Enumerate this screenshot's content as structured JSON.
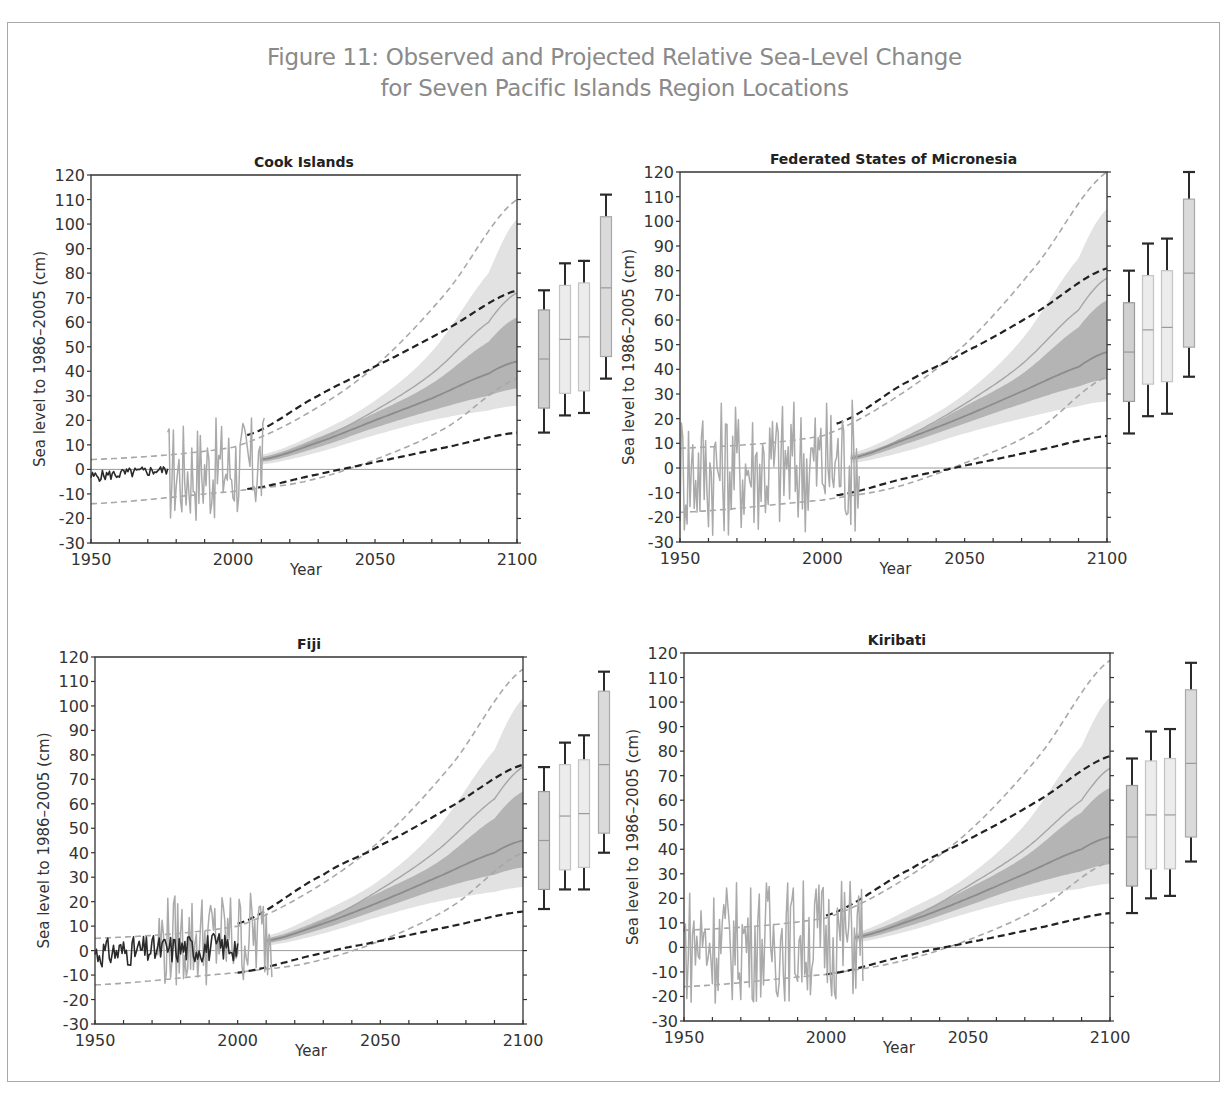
{
  "figure": {
    "title_line1": "Figure 11: Observed and Projected Relative Sea-Level Change",
    "title_line2": "for Seven Pacific Islands Region Locations"
  },
  "colors": {
    "title": "#8a8a8a",
    "axis": "#333333",
    "zero_line": "#9a9a9a",
    "obs_tide_gauge_dark": "#2a2a2a",
    "obs_altimetry_light": "#aaaaaa",
    "band_light": "#e2e2e2",
    "band_dark": "#b4b4b4",
    "median_line": "#8c8c8c",
    "high_line": "#a6a6a6",
    "dash_black": "#222222",
    "dash_gray": "#a8a8a8",
    "box_dark": "#d0d0d0",
    "box_light": "#ececec",
    "box_mid": "#dadada",
    "whisker": "#2a2a2a"
  },
  "chart_data": [
    {
      "type": "line",
      "title": "Cook Islands",
      "xlabel": "Year",
      "ylabel": "Sea level to 1986–2005 (cm)",
      "xlim": [
        1950,
        2100
      ],
      "ylim": [
        -30,
        120
      ],
      "xticks": [
        1950,
        2000,
        2050,
        2100
      ],
      "yticks": [
        -30,
        -20,
        -10,
        0,
        10,
        20,
        30,
        40,
        50,
        60,
        70,
        80,
        90,
        100,
        110,
        120
      ],
      "grid": false,
      "plot_px": {
        "left": 91,
        "top": 175,
        "right": 517,
        "bottom": 543
      },
      "box_x": [
        544,
        565,
        584,
        606
      ],
      "observed_dark": {
        "x_range": [
          1950,
          1977
        ],
        "values_range": [
          -7,
          1
        ]
      },
      "observed_light": {
        "x_range": [
          1977,
          2011
        ],
        "values_range": [
          -24,
          21
        ]
      },
      "projection_light_band": {
        "x": [
          2010,
          2030,
          2050,
          2070,
          2090,
          2100
        ],
        "low": [
          2,
          7,
          14,
          20,
          24,
          26
        ],
        "high": [
          6,
          15,
          28,
          48,
          80,
          102
        ]
      },
      "projection_dark_band": {
        "x": [
          2010,
          2030,
          2050,
          2070,
          2090,
          2100
        ],
        "low": [
          3,
          9,
          17,
          24,
          30,
          33
        ],
        "high": [
          5,
          13,
          23,
          35,
          52,
          62
        ]
      },
      "median_line": {
        "x": [
          2010,
          2030,
          2050,
          2070,
          2090,
          2100
        ],
        "y": [
          4,
          11,
          20,
          29,
          39,
          44
        ]
      },
      "high_scenario_line": {
        "x": [
          2010,
          2030,
          2050,
          2070,
          2090,
          2100
        ],
        "y": [
          4,
          12,
          24,
          39,
          60,
          72
        ]
      },
      "dashed_black_upper": {
        "x": [
          2005,
          2030,
          2050,
          2075,
          2100
        ],
        "y": [
          14,
          30,
          42,
          57,
          73
        ]
      },
      "dashed_black_lower": {
        "x": [
          2005,
          2030,
          2050,
          2075,
          2100
        ],
        "y": [
          -8,
          -2,
          3,
          9,
          15
        ]
      },
      "dashed_gray_upper": {
        "x": [
          1950,
          2000,
          2025,
          2050,
          2075,
          2100
        ],
        "y": [
          4,
          9,
          22,
          42,
          72,
          110
        ]
      },
      "dashed_gray_lower": {
        "x": [
          1950,
          2000,
          2025,
          2050,
          2075,
          2100
        ],
        "y": [
          -14,
          -9,
          -5,
          4,
          17,
          37
        ]
      },
      "boxes": [
        {
          "name": "RCP2.6",
          "fill": "dark",
          "whisker_low": 15,
          "q1": 25,
          "median": 45,
          "q3": 65,
          "whisker_high": 73
        },
        {
          "name": "RCP4.5",
          "fill": "light",
          "whisker_low": 22,
          "q1": 31,
          "median": 53,
          "q3": 75,
          "whisker_high": 84
        },
        {
          "name": "RCP6.0",
          "fill": "light",
          "whisker_low": 23,
          "q1": 32,
          "median": 54,
          "q3": 76,
          "whisker_high": 85
        },
        {
          "name": "RCP8.5",
          "fill": "mid",
          "whisker_low": 37,
          "q1": 46,
          "median": 74,
          "q3": 103,
          "whisker_high": 112
        }
      ]
    },
    {
      "type": "line",
      "title": "Federated States of Micronesia",
      "xlabel": "Year",
      "ylabel": "Sea level to 1986–2005 (cm)",
      "xlim": [
        1950,
        2100
      ],
      "ylim": [
        -30,
        120
      ],
      "xticks": [
        1950,
        2000,
        2050,
        2100
      ],
      "yticks": [
        -30,
        -20,
        -10,
        0,
        10,
        20,
        30,
        40,
        50,
        60,
        70,
        80,
        90,
        100,
        110,
        120
      ],
      "grid": false,
      "plot_px": {
        "left": 680,
        "top": 172,
        "right": 1107,
        "bottom": 542
      },
      "box_x": [
        1129,
        1148,
        1167,
        1189
      ],
      "observed_dark": null,
      "observed_light": {
        "x_range": [
          1950,
          2013
        ],
        "values_range": [
          -30,
          29
        ]
      },
      "projection_light_band": {
        "x": [
          2010,
          2030,
          2050,
          2070,
          2090,
          2100
        ],
        "low": [
          2,
          7,
          14,
          20,
          25,
          27
        ],
        "high": [
          6,
          16,
          30,
          52,
          85,
          105
        ]
      },
      "projection_dark_band": {
        "x": [
          2010,
          2030,
          2050,
          2070,
          2090,
          2100
        ],
        "low": [
          3,
          10,
          18,
          26,
          33,
          36
        ],
        "high": [
          5,
          13,
          25,
          38,
          57,
          68
        ]
      },
      "median_line": {
        "x": [
          2010,
          2030,
          2050,
          2070,
          2090,
          2100
        ],
        "y": [
          4,
          12,
          21,
          31,
          41,
          47
        ]
      },
      "high_scenario_line": {
        "x": [
          2010,
          2030,
          2050,
          2070,
          2090,
          2100
        ],
        "y": [
          4,
          13,
          26,
          42,
          64,
          77
        ]
      },
      "dashed_black_upper": {
        "x": [
          2005,
          2030,
          2050,
          2075,
          2100
        ],
        "y": [
          18,
          35,
          47,
          63,
          81
        ]
      },
      "dashed_black_lower": {
        "x": [
          2005,
          2030,
          2050,
          2075,
          2100
        ],
        "y": [
          -11,
          -4,
          1,
          7,
          13
        ]
      },
      "dashed_gray_upper": {
        "x": [
          1950,
          2000,
          2025,
          2050,
          2075,
          2100
        ],
        "y": [
          8,
          13,
          28,
          50,
          82,
          120
        ]
      },
      "dashed_gray_lower": {
        "x": [
          1950,
          2000,
          2025,
          2050,
          2075,
          2100
        ],
        "y": [
          -18,
          -13,
          -8,
          2,
          15,
          37
        ]
      },
      "boxes": [
        {
          "name": "RCP2.6",
          "fill": "dark",
          "whisker_low": 14,
          "q1": 27,
          "median": 47,
          "q3": 67,
          "whisker_high": 80
        },
        {
          "name": "RCP4.5",
          "fill": "light",
          "whisker_low": 21,
          "q1": 34,
          "median": 56,
          "q3": 78,
          "whisker_high": 91
        },
        {
          "name": "RCP6.0",
          "fill": "light",
          "whisker_low": 22,
          "q1": 35,
          "median": 57,
          "q3": 80,
          "whisker_high": 93
        },
        {
          "name": "RCP8.5",
          "fill": "mid",
          "whisker_low": 37,
          "q1": 49,
          "median": 79,
          "q3": 109,
          "whisker_high": 120
        }
      ]
    },
    {
      "type": "line",
      "title": "Fiji",
      "xlabel": "Year",
      "ylabel": "Sea level to 1986–2005 (cm)",
      "xlim": [
        1950,
        2100
      ],
      "ylim": [
        -30,
        120
      ],
      "xticks": [
        1950,
        2000,
        2050,
        2100
      ],
      "yticks": [
        -30,
        -20,
        -10,
        0,
        10,
        20,
        30,
        40,
        50,
        60,
        70,
        80,
        90,
        100,
        110,
        120
      ],
      "grid": false,
      "plot_px": {
        "left": 95,
        "top": 657,
        "right": 523,
        "bottom": 1024
      },
      "box_x": [
        544,
        565,
        584,
        604
      ],
      "observed_dark": {
        "x_range": [
          1950,
          2000
        ],
        "values_range": [
          -12,
          10
        ]
      },
      "observed_light": {
        "x_range": [
          1972,
          2012
        ],
        "values_range": [
          -17,
          24
        ]
      },
      "projection_light_band": {
        "x": [
          2010,
          2030,
          2050,
          2070,
          2090,
          2100
        ],
        "low": [
          2,
          7,
          14,
          20,
          24,
          26
        ],
        "high": [
          6,
          16,
          29,
          50,
          82,
          103
        ]
      },
      "projection_dark_band": {
        "x": [
          2010,
          2030,
          2050,
          2070,
          2090,
          2100
        ],
        "low": [
          3,
          9,
          17,
          25,
          31,
          34
        ],
        "high": [
          5,
          13,
          24,
          36,
          54,
          65
        ]
      },
      "median_line": {
        "x": [
          2010,
          2030,
          2050,
          2070,
          2090,
          2100
        ],
        "y": [
          4,
          11,
          20,
          30,
          40,
          45
        ]
      },
      "high_scenario_line": {
        "x": [
          2010,
          2030,
          2050,
          2070,
          2090,
          2100
        ],
        "y": [
          4,
          12,
          25,
          41,
          62,
          75
        ]
      },
      "dashed_black_upper": {
        "x": [
          2000,
          2030,
          2050,
          2075,
          2100
        ],
        "y": [
          11,
          31,
          43,
          59,
          76
        ]
      },
      "dashed_black_lower": {
        "x": [
          2000,
          2030,
          2050,
          2075,
          2100
        ],
        "y": [
          -9,
          -1,
          4,
          10,
          16
        ]
      },
      "dashed_gray_upper": {
        "x": [
          1950,
          2000,
          2025,
          2050,
          2075,
          2100
        ],
        "y": [
          5,
          10,
          24,
          45,
          76,
          115
        ]
      },
      "dashed_gray_lower": {
        "x": [
          1950,
          2000,
          2025,
          2050,
          2075,
          2100
        ],
        "y": [
          -14,
          -9,
          -5,
          4,
          18,
          40
        ]
      },
      "boxes": [
        {
          "name": "RCP2.6",
          "fill": "dark",
          "whisker_low": 17,
          "q1": 25,
          "median": 45,
          "q3": 65,
          "whisker_high": 75
        },
        {
          "name": "RCP4.5",
          "fill": "light",
          "whisker_low": 25,
          "q1": 33,
          "median": 55,
          "q3": 76,
          "whisker_high": 85
        },
        {
          "name": "RCP6.0",
          "fill": "light",
          "whisker_low": 25,
          "q1": 34,
          "median": 56,
          "q3": 78,
          "whisker_high": 88
        },
        {
          "name": "RCP8.5",
          "fill": "mid",
          "whisker_low": 40,
          "q1": 48,
          "median": 76,
          "q3": 106,
          "whisker_high": 114
        }
      ]
    },
    {
      "type": "line",
      "title": "Kiribati",
      "xlabel": "Year",
      "ylabel": "Sea level to 1986–2005 (cm)",
      "xlim": [
        1950,
        2100
      ],
      "ylim": [
        -30,
        120
      ],
      "xticks": [
        1950,
        2000,
        2050,
        2100
      ],
      "yticks": [
        -30,
        -20,
        -10,
        0,
        10,
        20,
        30,
        40,
        50,
        60,
        70,
        80,
        90,
        100,
        110,
        120
      ],
      "grid": false,
      "plot_px": {
        "left": 684,
        "top": 653,
        "right": 1110,
        "bottom": 1021
      },
      "box_x": [
        1132,
        1151,
        1170,
        1191
      ],
      "observed_dark": null,
      "observed_light": {
        "x_range": [
          1950,
          2013
        ],
        "values_range": [
          -25,
          28
        ]
      },
      "projection_light_band": {
        "x": [
          2010,
          2030,
          2050,
          2070,
          2090,
          2100
        ],
        "low": [
          2,
          7,
          14,
          20,
          24,
          26
        ],
        "high": [
          6,
          16,
          29,
          50,
          82,
          102
        ]
      },
      "projection_dark_band": {
        "x": [
          2010,
          2030,
          2050,
          2070,
          2090,
          2100
        ],
        "low": [
          3,
          9,
          17,
          25,
          31,
          34
        ],
        "high": [
          5,
          13,
          24,
          37,
          55,
          65
        ]
      },
      "median_line": {
        "x": [
          2010,
          2030,
          2050,
          2070,
          2090,
          2100
        ],
        "y": [
          4,
          11,
          20,
          30,
          40,
          45
        ]
      },
      "high_scenario_line": {
        "x": [
          2010,
          2030,
          2050,
          2070,
          2090,
          2100
        ],
        "y": [
          4,
          12,
          25,
          40,
          60,
          73
        ]
      },
      "dashed_black_upper": {
        "x": [
          2000,
          2030,
          2050,
          2075,
          2100
        ],
        "y": [
          13,
          32,
          44,
          60,
          78
        ]
      },
      "dashed_black_lower": {
        "x": [
          2000,
          2030,
          2050,
          2075,
          2100
        ],
        "y": [
          -11,
          -3,
          2,
          8,
          14
        ]
      },
      "dashed_gray_upper": {
        "x": [
          1950,
          2000,
          2025,
          2050,
          2075,
          2100
        ],
        "y": [
          7,
          12,
          26,
          47,
          78,
          117
        ]
      },
      "dashed_gray_lower": {
        "x": [
          1950,
          2000,
          2025,
          2050,
          2075,
          2100
        ],
        "y": [
          -16,
          -11,
          -6,
          3,
          16,
          35
        ]
      },
      "boxes": [
        {
          "name": "RCP2.6",
          "fill": "dark",
          "whisker_low": 14,
          "q1": 25,
          "median": 45,
          "q3": 66,
          "whisker_high": 77
        },
        {
          "name": "RCP4.5",
          "fill": "light",
          "whisker_low": 20,
          "q1": 32,
          "median": 54,
          "q3": 76,
          "whisker_high": 88
        },
        {
          "name": "RCP6.0",
          "fill": "light",
          "whisker_low": 21,
          "q1": 32,
          "median": 54,
          "q3": 77,
          "whisker_high": 89
        },
        {
          "name": "RCP8.5",
          "fill": "mid",
          "whisker_low": 35,
          "q1": 45,
          "median": 75,
          "q3": 105,
          "whisker_high": 116
        }
      ]
    }
  ]
}
